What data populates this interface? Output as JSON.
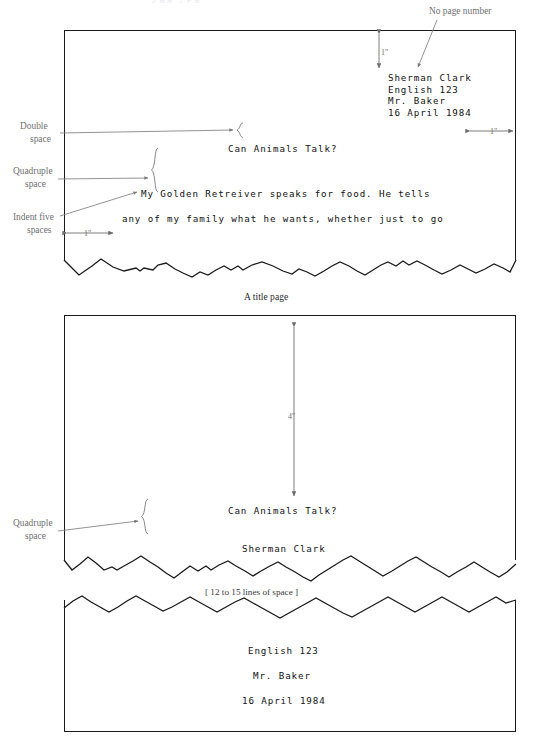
{
  "figure1": {
    "annotations": {
      "no_page_number": "No page number",
      "top_margin": "1\"",
      "right_margin": "1\"",
      "left_margin": "1\"",
      "double_space_line1": "Double",
      "double_space_line2": "space",
      "quadruple_space_line1": "Quadruple",
      "quadruple_space_line2": "space",
      "indent_line1": "Indent five",
      "indent_line2": "spaces"
    },
    "heading": [
      "Sherman Clark",
      "English 123",
      "Mr. Baker",
      "16 April 1984"
    ],
    "title": "Can Animals Talk?",
    "body": [
      "My Golden Retreiver speaks for food. He tells",
      "any of my family what he wants, whether just to go"
    ]
  },
  "caption": "A title page",
  "figure2": {
    "annotations": {
      "four_inches": "4\"",
      "quadruple_space_line1": "Quadruple",
      "quadruple_space_line2": "space",
      "lines_of_space": "[ 12 to 15 lines of space ]"
    },
    "title": "Can Animals Talk?",
    "author": "Sherman Clark",
    "footer": [
      "English 123",
      "Mr. Baker",
      "16 April 1984"
    ]
  },
  "colors": {
    "ink": "#111111",
    "annotation": "#6f6f6f",
    "rule": "#1a1a1a",
    "paper": "#ffffff"
  }
}
